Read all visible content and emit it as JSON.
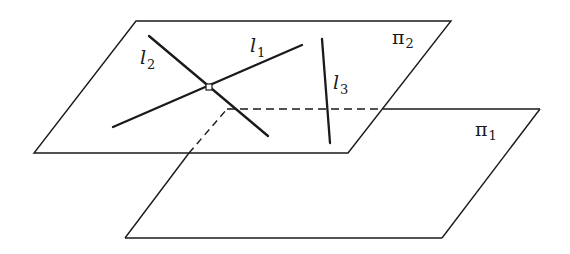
{
  "figure": {
    "colors": {
      "stroke": "#1a1a1a",
      "background": "#ffffff"
    },
    "planes": [
      {
        "id": "pi1",
        "label": "π",
        "subscript": "1"
      },
      {
        "id": "pi2",
        "label": "π",
        "subscript": "2"
      }
    ],
    "lines": [
      {
        "id": "l1",
        "label": "l",
        "subscript": "1"
      },
      {
        "id": "l2",
        "label": "l",
        "subscript": "2"
      },
      {
        "id": "l3",
        "label": "l",
        "subscript": "3"
      }
    ]
  }
}
